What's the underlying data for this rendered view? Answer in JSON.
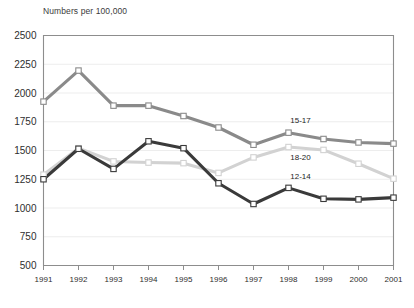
{
  "chart_data": {
    "type": "line",
    "title": "Numbers per 100,000",
    "xlabel": "",
    "ylabel": "Numbers per 100,000",
    "grid": true,
    "legend_position": "inline-right",
    "x": [
      "1991",
      "1992",
      "1993",
      "1994",
      "1995",
      "1996",
      "1997",
      "1998",
      "1999",
      "2000",
      "2001"
    ],
    "xlim": [
      "1991",
      "2001"
    ],
    "ylim": [
      500,
      2500
    ],
    "yticks": [
      500,
      750,
      1000,
      1250,
      1500,
      1750,
      2000,
      2250,
      2500
    ],
    "series": [
      {
        "name": "15-17",
        "color": "#8a8a8a",
        "label": "15-17",
        "values": [
          1925,
          2195,
          1890,
          1890,
          1800,
          1700,
          1550,
          1655,
          1600,
          1570,
          1560
        ]
      },
      {
        "name": "18-20",
        "color": "#d2d2d2",
        "label": "18-20",
        "values": [
          1290,
          1520,
          1405,
          1395,
          1390,
          1305,
          1440,
          1530,
          1505,
          1385,
          1255
        ]
      },
      {
        "name": "12-14",
        "color": "#3a3a3a",
        "label": "12-14",
        "values": [
          1250,
          1515,
          1340,
          1580,
          1520,
          1215,
          1035,
          1175,
          1080,
          1075,
          1090
        ]
      }
    ]
  },
  "axis": {
    "title": "Numbers per 100,000",
    "ytick_labels": [
      "2500",
      "2250",
      "2000",
      "1750",
      "1500",
      "1250",
      "1000",
      "750",
      "500"
    ],
    "xtick_labels": [
      "1991",
      "1992",
      "1993",
      "1994",
      "1995",
      "1996",
      "1997",
      "1998",
      "2000",
      "1999",
      "2001"
    ]
  },
  "colors": {
    "series_15_17": "#8a8a8a",
    "series_18_20": "#d2d2d2",
    "series_12_14": "#3a3a3a",
    "grid": "#e8e8e8",
    "axis": "#8d8d8d",
    "marker_fill": "#ffffff"
  }
}
